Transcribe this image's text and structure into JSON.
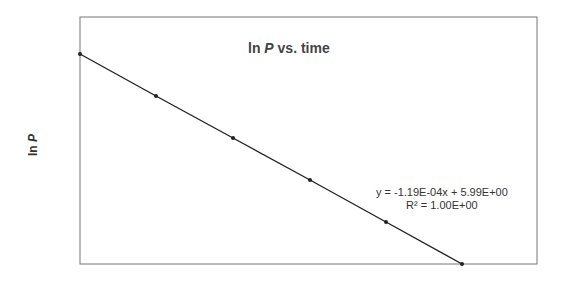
{
  "chart_data": {
    "type": "scatter",
    "title": "ln P vs. time",
    "title_parts": {
      "prefix": "ln ",
      "italic": "P",
      "suffix": " vs. time"
    },
    "xlabel": "",
    "ylabel": "ln P",
    "ylabel_parts": {
      "prefix": "ln ",
      "italic": "P"
    },
    "grid": false,
    "legend": null,
    "x_tick_labels": [],
    "y_tick_labels": [],
    "series": [
      {
        "name": "ln P",
        "x": [
          0,
          1,
          2,
          3,
          4,
          5
        ],
        "y": [
          5.99,
          5.87,
          5.75,
          5.63,
          5.51,
          5.39
        ],
        "marker": "dot",
        "color": "#222222"
      }
    ],
    "trendline": {
      "type": "linear",
      "slope": -0.000119,
      "intercept": 5.99,
      "r_squared": 1.0,
      "equation_label": "y = -1.19E-04x + 5.99E+00",
      "r2_label": "R² = 1.00E+00"
    },
    "pixel_points": [
      [
        80,
        54
      ],
      [
        156,
        96
      ],
      [
        233,
        138
      ],
      [
        310,
        180
      ],
      [
        386,
        222
      ],
      [
        462,
        264
      ]
    ],
    "frame": {
      "left": 80,
      "top": 17,
      "right": 537,
      "bottom": 264
    }
  }
}
